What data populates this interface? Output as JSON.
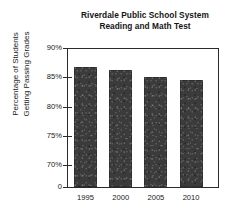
{
  "chart_data": {
    "type": "bar",
    "title": "Riverdale Public School System Reading and Math Test",
    "title_lines": [
      "Riverdale Public School System",
      "Reading and Math Test"
    ],
    "xlabel": "",
    "ylabel": "Percentage of Students Getting Passing Grades",
    "ylabel_lines": [
      "Percentage of Students",
      "Getting Passing Grades"
    ],
    "categories": [
      "1995",
      "2000",
      "2005",
      "2010"
    ],
    "values": [
      86.8,
      86.3,
      85.1,
      84.5
    ],
    "ylim": [
      70,
      90
    ],
    "axis_break": true,
    "y_ticks": [
      {
        "label": "90%",
        "value": 90
      },
      {
        "label": "85%",
        "value": 85
      },
      {
        "label": "80%",
        "value": 80
      },
      {
        "label": "75%",
        "value": 75
      },
      {
        "label": "70%",
        "value": 70
      }
    ],
    "y_zero_tick": {
      "label": "0",
      "value": 0
    },
    "grid": false,
    "legend": null,
    "bar_color": "#3b3b3b",
    "axis_color": "#2b2b2b",
    "background_color": "#ffffff"
  }
}
